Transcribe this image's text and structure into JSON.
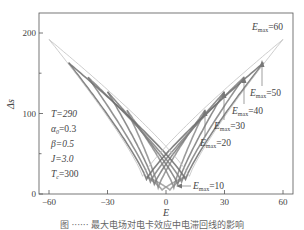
{
  "chart_data": {
    "type": "line",
    "title": "",
    "xlabel": "E",
    "ylabel": "Δs",
    "xlim": [
      -65,
      65
    ],
    "ylim": [
      0,
      225
    ],
    "xticks": [
      -60,
      -30,
      0,
      30,
      60
    ],
    "yticks": [
      0,
      100,
      200
    ],
    "grid": false,
    "legend": "none",
    "parameters": [
      {
        "label": "T=290"
      },
      {
        "label": "α₀=0.3"
      },
      {
        "label": "β=0.5"
      },
      {
        "label": "J=3.0"
      },
      {
        "label": "Tc=300"
      }
    ],
    "series": [
      {
        "name": "Emax=10",
        "emax": 10,
        "end_value": 22,
        "min_value": 5,
        "coercive": 2,
        "color": "#9a9a9a"
      },
      {
        "name": "Emax=20",
        "emax": 20,
        "end_value": 104,
        "min_value": 8,
        "coercive": 4,
        "color": "#8a8a8a"
      },
      {
        "name": "Emax=30",
        "emax": 30,
        "end_value": 127,
        "min_value": 12,
        "coercive": 6,
        "color": "#7a7a7a"
      },
      {
        "name": "Emax=40",
        "emax": 40,
        "end_value": 145,
        "min_value": 15,
        "coercive": 8,
        "color": "#808080"
      },
      {
        "name": "Emax=50",
        "emax": 50,
        "end_value": 163,
        "min_value": 18,
        "coercive": 10,
        "color": "#6e6e6e"
      },
      {
        "name": "Emax=60",
        "emax": 60,
        "end_value": 192,
        "min_value": 22,
        "coercive": 12,
        "color": "#bdbdbd"
      }
    ],
    "annotations": [
      {
        "text": "Emax=60",
        "x": 60,
        "y": 192
      },
      {
        "text": "Emax=50",
        "x": 50,
        "y": 163
      },
      {
        "text": "Emax=40",
        "x": 40,
        "y": 145
      },
      {
        "text": "Emax=30",
        "x": 30,
        "y": 127
      },
      {
        "text": "Emax=20",
        "x": 20,
        "y": 104
      },
      {
        "text": "Emax=10",
        "x": 6,
        "y": 10
      }
    ]
  },
  "axes": {
    "xlabel": "E",
    "ylabel": "Δs",
    "xtick_labels": [
      "−60",
      "−30",
      "0",
      "30",
      "60"
    ],
    "ytick_labels": [
      "0",
      "100",
      "200"
    ]
  },
  "params": {
    "T": "T=290",
    "alpha": "α",
    "alpha_sub": "0",
    "alpha_val": "=0.3",
    "beta": "β=0.5",
    "J": "J=3.0",
    "Tc": "T",
    "Tc_sub": "c",
    "Tc_val": "=300"
  },
  "labels": {
    "E": "E",
    "max": "max",
    "eq60": "=60",
    "eq50": "=50",
    "eq40": "=40",
    "eq30": "=30",
    "eq20": "=20",
    "eq10": "=10"
  },
  "caption": "图 ······ 最大电场对电卡效应中电滞回线的影响"
}
